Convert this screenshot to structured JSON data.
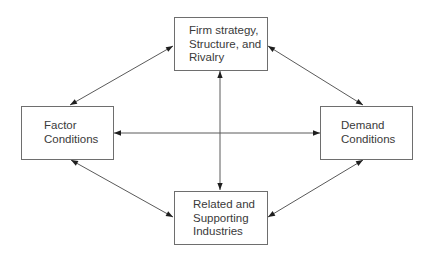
{
  "diagram": {
    "type": "Porter's Diamond",
    "colors": {
      "line": "#5a5a5a",
      "box_border": "#6e6e6e",
      "text": "#3a3a3a",
      "background": "#ffffff"
    },
    "nodes": {
      "top": {
        "id": "firm-strategy",
        "label": "Firm strategy,\nStructure, and\nRivalry"
      },
      "left": {
        "id": "factor-conditions",
        "label": "Factor\nConditions"
      },
      "right": {
        "id": "demand-conditions",
        "label": "Demand\nConditions"
      },
      "bottom": {
        "id": "related-supporting",
        "label": "Related and\nSupporting\nIndustries"
      }
    },
    "edges": [
      {
        "from": "firm-strategy",
        "to": "factor-conditions",
        "bidirectional": true
      },
      {
        "from": "firm-strategy",
        "to": "demand-conditions",
        "bidirectional": true
      },
      {
        "from": "related-supporting",
        "to": "factor-conditions",
        "bidirectional": true
      },
      {
        "from": "related-supporting",
        "to": "demand-conditions",
        "bidirectional": true
      },
      {
        "from": "factor-conditions",
        "to": "demand-conditions",
        "bidirectional": true
      },
      {
        "from": "firm-strategy",
        "to": "related-supporting",
        "bidirectional": true
      }
    ]
  }
}
